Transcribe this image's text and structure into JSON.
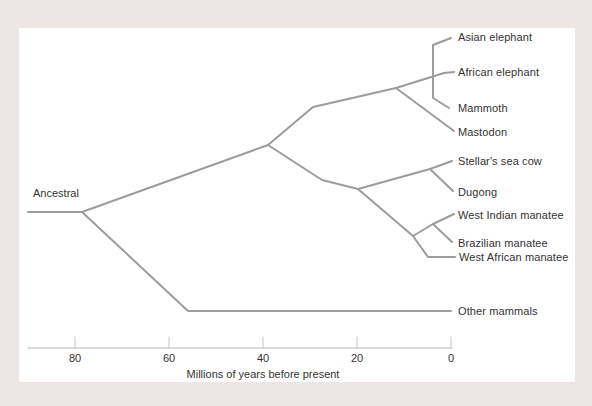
{
  "colors": {
    "frame_background": "#ece6e5",
    "panel_background": "#ffffff",
    "branch_line": "#9c9c9c",
    "axis_line": "#b5b5b5",
    "tick_line": "#c6c6c6",
    "text": "#333333"
  },
  "chart_data": {
    "type": "phylogenetic-tree",
    "title": "",
    "xlabel": "Millions of years before present",
    "x_axis_direction": "time before present, decreasing left to right",
    "x_range_mya": [
      90,
      0
    ],
    "root_label": {
      "text": "Ancestral",
      "x": 33,
      "y": 193
    },
    "taxa": [
      {
        "name": "Asian elephant",
        "x": 458,
        "y": 37
      },
      {
        "name": "African elephant",
        "x": 458,
        "y": 72
      },
      {
        "name": "Mammoth",
        "x": 458,
        "y": 108
      },
      {
        "name": "Mastodon",
        "x": 458,
        "y": 132
      },
      {
        "name": "Stellar's sea cow",
        "x": 458,
        "y": 161
      },
      {
        "name": "Dugong",
        "x": 458,
        "y": 192
      },
      {
        "name": "West Indian manatee",
        "x": 458,
        "y": 215
      },
      {
        "name": "Brazilian manatee",
        "x": 458,
        "y": 243
      },
      {
        "name": "West African manatee",
        "x": 459,
        "y": 257
      },
      {
        "name": "Other mammals",
        "x": 458,
        "y": 311
      }
    ],
    "branches": [
      {
        "name": "root-stem",
        "points": [
          [
            28,
            212
          ],
          [
            82,
            212
          ]
        ]
      },
      {
        "name": "root-to-main-vertex",
        "points": [
          [
            82,
            212
          ],
          [
            268,
            145
          ]
        ]
      },
      {
        "name": "other-mammals",
        "points": [
          [
            82,
            212
          ],
          [
            188,
            311
          ],
          [
            451,
            311
          ]
        ]
      },
      {
        "name": "elephant-stem",
        "points": [
          [
            268,
            145
          ],
          [
            313,
            107
          ],
          [
            396,
            88
          ]
        ]
      },
      {
        "name": "african-elephant",
        "points": [
          [
            396,
            88
          ],
          [
            444,
            73
          ],
          [
            454,
            72
          ]
        ]
      },
      {
        "name": "elephantid-bar",
        "points": [
          [
            451,
            38
          ],
          [
            433,
            45
          ],
          [
            433,
            98
          ],
          [
            449,
            108
          ]
        ]
      },
      {
        "name": "mastodon",
        "points": [
          [
            396,
            88
          ],
          [
            454,
            131
          ]
        ]
      },
      {
        "name": "sirenian-stem",
        "points": [
          [
            268,
            145
          ],
          [
            322,
            180
          ],
          [
            358,
            189
          ]
        ]
      },
      {
        "name": "dugongid-stellars",
        "points": [
          [
            358,
            189
          ],
          [
            430,
            169
          ],
          [
            452,
            161
          ]
        ]
      },
      {
        "name": "dugong",
        "points": [
          [
            430,
            169
          ],
          [
            453,
            191
          ]
        ]
      },
      {
        "name": "manatee-stem",
        "points": [
          [
            358,
            189
          ],
          [
            413,
            236
          ]
        ]
      },
      {
        "name": "west-indian-manatee",
        "points": [
          [
            413,
            236
          ],
          [
            433,
            224
          ],
          [
            454,
            214
          ]
        ]
      },
      {
        "name": "brazilian-manatee",
        "points": [
          [
            433,
            224
          ],
          [
            452,
            242
          ]
        ]
      },
      {
        "name": "west-african-manatee",
        "points": [
          [
            413,
            236
          ],
          [
            428,
            257
          ],
          [
            455,
            257
          ]
        ]
      }
    ],
    "nodes_mya_estimates": [
      {
        "node": "other-mammals-vs-elephant-sirenian-lineage",
        "mya": 79
      },
      {
        "node": "elephants-vs-sea-cows",
        "mya": 39
      },
      {
        "node": "mastodon-split",
        "mya": 12
      },
      {
        "node": "asian-african-mammoth-trichotomy",
        "mya": 4
      },
      {
        "node": "dugongids-vs-manatees",
        "mya": 20
      },
      {
        "node": "stellars-sea-cow-vs-dugong",
        "mya": 4.5
      },
      {
        "node": "west-african-manatee-split",
        "mya": 8
      },
      {
        "node": "west-indian-vs-brazilian",
        "mya": 4
      }
    ],
    "axis": {
      "y": 348,
      "x_start": 28,
      "x_end": 452,
      "tick_length": 11,
      "ticks": [
        {
          "label": "80",
          "x": 75
        },
        {
          "label": "60",
          "x": 169
        },
        {
          "label": "40",
          "x": 263
        },
        {
          "label": "20",
          "x": 357
        },
        {
          "label": "0",
          "x": 451
        }
      ],
      "title": "Millions of years before present",
      "title_x": 263,
      "title_y": 368
    }
  }
}
